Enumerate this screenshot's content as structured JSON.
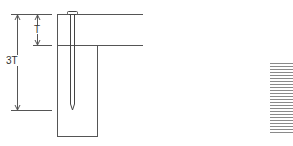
{
  "diagram": {
    "title": "",
    "labels": {
      "total_depth": "3T",
      "thickness": "T"
    },
    "colors": {
      "stroke": "#555555",
      "hatch": "#8a8a8a",
      "background": "#ffffff"
    },
    "elements": [
      {
        "name": "top-board",
        "description": "horizontal board of thickness T"
      },
      {
        "name": "vertical-post",
        "description": "vertical member receiving the nail"
      },
      {
        "name": "nail",
        "description": "nail penetrating 3T total depth"
      },
      {
        "name": "hatched-swatch",
        "description": "grain/hatch sample block at right"
      }
    ]
  }
}
